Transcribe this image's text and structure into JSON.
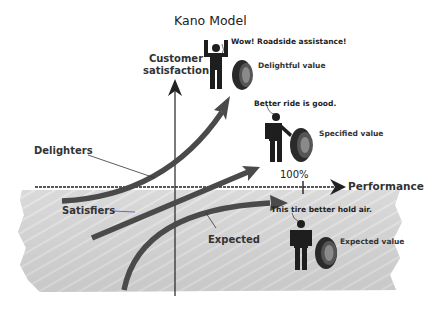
{
  "title": "Kano Model",
  "axes": {
    "y_label": "Customer satisfaction",
    "x_label": "Performance",
    "x_tick_label": "100%"
  },
  "curves": [
    {
      "id": "delighters",
      "label": "Delighters"
    },
    {
      "id": "satisfiers",
      "label": "Satisfiers"
    },
    {
      "id": "expected",
      "label": "Expected"
    }
  ],
  "figures": [
    {
      "id": "delightful",
      "quote": "Wow! Roadside assistance!",
      "value_label": "Delightful value",
      "pose": "arms-raised"
    },
    {
      "id": "specified",
      "quote": "Better ride is good.",
      "value_label": "Specified value",
      "pose": "hand-on-tire"
    },
    {
      "id": "expected",
      "quote": "This tire better hold air.",
      "value_label": "Expected value",
      "pose": "standing"
    }
  ],
  "colors": {
    "curve": "#4a4a4a",
    "axis": "#222222",
    "shade": "#c8c8c8",
    "figure": "#1e1e1e",
    "leader_satisfiers": "#5a5ad0"
  }
}
